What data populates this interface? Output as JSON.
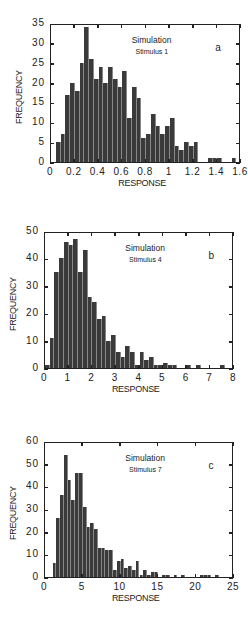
{
  "chart_data": [
    {
      "type": "bar",
      "panel_label": "a",
      "title": "Simulation",
      "subtitle": "Stimulus 1",
      "xlabel": "RESPONSE",
      "ylabel": "FREQUENCY",
      "xlim": [
        0,
        1.6
      ],
      "ylim": [
        0,
        35
      ],
      "xticks": [
        "0",
        "0.2",
        "0.4",
        "0.6",
        "0.8",
        "1",
        "1.2",
        "1.4",
        "1.6"
      ],
      "yticks": [
        "0",
        "5",
        "10",
        "15",
        "20",
        "25",
        "30",
        "35"
      ],
      "bin_width": 0.04,
      "x": [
        0.06,
        0.1,
        0.14,
        0.18,
        0.22,
        0.26,
        0.3,
        0.34,
        0.38,
        0.42,
        0.46,
        0.5,
        0.54,
        0.58,
        0.62,
        0.66,
        0.7,
        0.74,
        0.78,
        0.82,
        0.86,
        0.9,
        0.94,
        0.98,
        1.02,
        1.06,
        1.1,
        1.14,
        1.18,
        1.22,
        1.34,
        1.38,
        1.42,
        1.54
      ],
      "values": [
        5,
        7,
        17,
        20,
        18,
        25,
        34,
        26,
        21,
        24,
        20,
        24,
        21,
        19,
        23,
        11,
        19,
        16,
        6,
        7,
        12,
        9,
        7,
        9,
        11,
        4,
        3,
        5,
        4,
        5,
        1,
        1,
        1,
        1
      ]
    },
    {
      "type": "bar",
      "panel_label": "b",
      "title": "Simulation",
      "subtitle": "Stimulus 4",
      "xlabel": "RESPONSE",
      "ylabel": "FREQUENCY",
      "xlim": [
        0,
        8
      ],
      "ylim": [
        0,
        50
      ],
      "xticks": [
        "0",
        "1",
        "2",
        "3",
        "4",
        "5",
        "6",
        "7",
        "8"
      ],
      "yticks": [
        "0",
        "10",
        "20",
        "30",
        "40",
        "50"
      ],
      "bin_width": 0.2,
      "x": [
        0.1,
        0.3,
        0.5,
        0.7,
        0.9,
        1.1,
        1.3,
        1.5,
        1.7,
        1.9,
        2.1,
        2.3,
        2.5,
        2.7,
        2.9,
        3.1,
        3.3,
        3.5,
        3.7,
        3.9,
        4.1,
        4.3,
        4.5,
        4.7,
        4.9,
        5.1,
        5.3,
        5.5,
        6.1,
        6.5,
        7.5
      ],
      "values": [
        1,
        11,
        35,
        40,
        46,
        45,
        47,
        35,
        43,
        26,
        24,
        18,
        19,
        10,
        12,
        6,
        4,
        8,
        6,
        1,
        6,
        3,
        4,
        1,
        1,
        2,
        1,
        1,
        1,
        1,
        1
      ]
    },
    {
      "type": "bar",
      "panel_label": "c",
      "title": "Simulation",
      "subtitle": "Stimulus 7",
      "xlabel": "RESPONSE",
      "ylabel": "FREQUENCY",
      "xlim": [
        0,
        25
      ],
      "ylim": [
        0,
        60
      ],
      "xticks": [
        "0",
        "5",
        "10",
        "15",
        "20",
        "25"
      ],
      "yticks": [
        "0",
        "10",
        "20",
        "30",
        "40",
        "50",
        "60"
      ],
      "bin_width": 0.5,
      "x": [
        1.25,
        1.75,
        2.25,
        2.75,
        3.25,
        3.75,
        4.25,
        4.75,
        5.25,
        5.75,
        6.25,
        6.75,
        7.25,
        7.75,
        8.25,
        8.75,
        9.25,
        9.75,
        10.25,
        10.75,
        11.25,
        11.75,
        12.25,
        12.75,
        13.25,
        13.75,
        14.25,
        14.75,
        15.75,
        16.25,
        17.25,
        18.25,
        20.75,
        21.25,
        21.75,
        22.75
      ],
      "values": [
        6,
        26,
        36,
        54,
        43,
        34,
        46,
        46,
        31,
        22,
        24,
        21,
        13,
        13,
        12,
        12,
        3,
        7,
        8,
        4,
        5,
        3,
        7,
        1,
        3,
        1,
        2,
        2,
        1,
        1,
        1,
        1,
        1,
        1,
        1,
        1
      ]
    }
  ]
}
